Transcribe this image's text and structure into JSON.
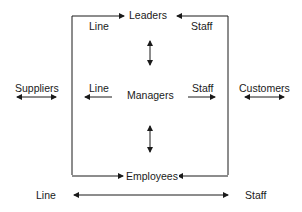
{
  "diagram": {
    "nodes": {
      "leaders": "Leaders",
      "managers": "Managers",
      "employees": "Employees",
      "suppliers": "Suppliers",
      "customers": "Customers"
    },
    "labels": {
      "top_line": "Line",
      "top_staff": "Staff",
      "mid_line": "Line",
      "mid_staff": "Staff",
      "bottom_line": "Line",
      "bottom_staff": "Staff"
    },
    "colors": {
      "stroke": "#1a1a1a",
      "background": "#ffffff"
    }
  }
}
